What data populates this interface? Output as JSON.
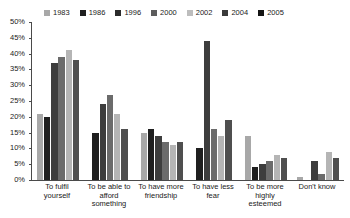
{
  "chart_data": {
    "type": "bar",
    "title": "",
    "xlabel": "",
    "ylabel": "",
    "ylim": [
      0,
      50
    ],
    "ytick_labels": [
      "50%",
      "45%",
      "40%",
      "35%",
      "30%",
      "25%",
      "20%",
      "15%",
      "10%",
      "5%",
      "0%"
    ],
    "ytick_values": [
      50,
      45,
      40,
      35,
      30,
      25,
      20,
      15,
      10,
      5,
      0
    ],
    "grid": false,
    "legend_position": "top",
    "categories": [
      "To fulfil yourself",
      "To be able to afford something",
      "To have more friendship",
      "To have less fear",
      "To be more highly esteemed",
      "Don't know"
    ],
    "series": [
      {
        "name": "1983",
        "color": "#a8a8a8",
        "values": [
          21,
          null,
          15,
          null,
          14,
          1
        ]
      },
      {
        "name": "1986",
        "color": "#1f1f1f",
        "values": [
          20,
          15,
          16,
          10,
          4,
          0
        ]
      },
      {
        "name": "1996",
        "color": "#3d3d3d",
        "values": [
          37,
          24,
          14,
          44,
          5,
          6
        ]
      },
      {
        "name": "2000",
        "color": "#6b6b6b",
        "values": [
          39,
          27,
          12,
          16,
          6,
          2
        ]
      },
      {
        "name": "2002",
        "color": "#b5b5b5",
        "values": [
          41,
          21,
          11,
          14,
          8,
          9
        ]
      },
      {
        "name": "2004",
        "color": "#4f4f4f",
        "values": [
          38,
          16,
          12,
          19,
          7,
          7
        ]
      }
    ]
  },
  "legend": {
    "items": [
      {
        "label": "1983",
        "color": "#a8a8a8"
      },
      {
        "label": "1986",
        "color": "#1f1f1f"
      },
      {
        "label": "1996",
        "color": "#2b2b2b"
      },
      {
        "label": "2000",
        "color": "#5c5c5c"
      },
      {
        "label": "2002",
        "color": "#bdbdbd"
      },
      {
        "label": "2004",
        "color": "#3a3a3a"
      },
      {
        "label": "2005",
        "color": "#141414"
      }
    ]
  }
}
